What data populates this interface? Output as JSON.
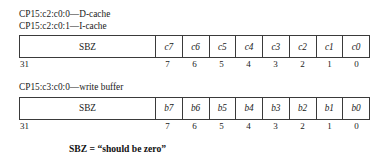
{
  "figure": {
    "note": "SBZ = “should be zero”"
  },
  "blocks": [
    {
      "captions": [
        "CP15:c2:c0:0—D-cache",
        "CP15:c2:c0:1—I-cache"
      ],
      "field_label": "SBZ",
      "msb_label": "31",
      "cells": [
        "c7",
        "c6",
        "c5",
        "c4",
        "c3",
        "c2",
        "c1",
        "c0"
      ],
      "bit_numbers": [
        "7",
        "6",
        "5",
        "4",
        "3",
        "2",
        "1",
        "0"
      ]
    },
    {
      "captions": [
        "CP15:c3:c0:0—write buffer"
      ],
      "field_label": "SBZ",
      "msb_label": "31",
      "cells": [
        "b7",
        "b6",
        "b5",
        "b4",
        "b3",
        "b2",
        "b1",
        "b0"
      ],
      "bit_numbers": [
        "7",
        "6",
        "5",
        "4",
        "3",
        "2",
        "1",
        "0"
      ]
    }
  ]
}
